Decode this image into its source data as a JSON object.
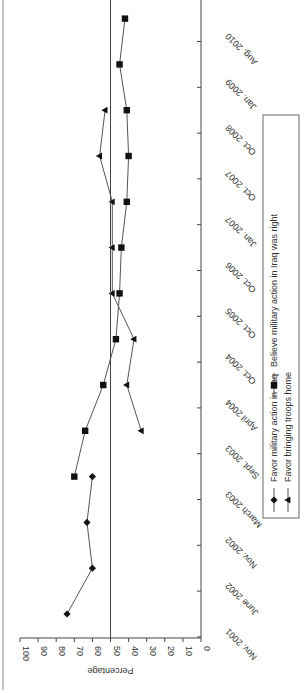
{
  "chart_data": {
    "type": "line",
    "orientation": "rotated 90 degrees (categories run vertically, value axis horizontal)",
    "title": "",
    "xlabel": "",
    "ylabel": "Percentage",
    "ylim": [
      0,
      100
    ],
    "yticks": [
      0,
      10,
      20,
      30,
      40,
      50,
      60,
      70,
      80,
      90,
      100
    ],
    "reference_line": 50,
    "grid": false,
    "legend_position": "right (rotated, below plot in original orientation)",
    "categories": [
      "Nov. 2001",
      "June 2002",
      "Nov. 2002",
      "March 2003",
      "Sept. 2003",
      "April 2004",
      "Oct. 2004",
      "Oct. 2005",
      "Oct. 2006",
      "Jan. 2007",
      "Oct. 2007",
      "Oct. 2008",
      "Jan. 2009",
      "Aug. 2010"
    ],
    "series": [
      {
        "name": "Favor military action in Iraq",
        "marker": "diamond",
        "values": [
          74,
          60,
          63,
          60,
          null,
          null,
          null,
          null,
          null,
          null,
          null,
          null,
          null,
          null
        ]
      },
      {
        "name": "Favor bringing troops home",
        "marker": "triangle",
        "values": [
          null,
          null,
          null,
          null,
          33,
          41,
          37,
          49,
          49,
          49,
          56,
          53,
          null,
          null
        ]
      },
      {
        "name": "Believe military action in Iraq was right",
        "marker": "square",
        "values": [
          null,
          null,
          null,
          70,
          64,
          54,
          47,
          45,
          44,
          41,
          40,
          41,
          45,
          42
        ]
      }
    ]
  },
  "axis": {
    "ylabel": "Percentage"
  },
  "legend": {
    "items": [
      {
        "label": "Favor military action in Iraq",
        "marker": "diamond"
      },
      {
        "label": "Favor bringing troops home",
        "marker": "triangle"
      },
      {
        "label": "Believe military action in Iraq was right",
        "marker": "square"
      }
    ]
  },
  "colors": {
    "line": "#555555",
    "marker": "#111111",
    "axis": "#444444",
    "text": "#333333"
  }
}
